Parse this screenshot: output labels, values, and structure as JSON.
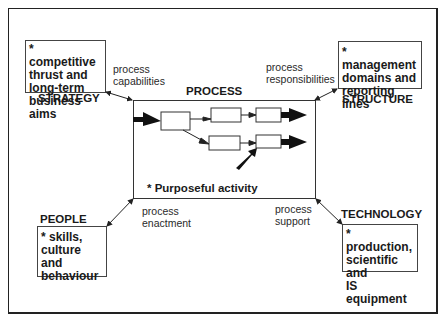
{
  "diagram": {
    "center": {
      "title": "PROCESS",
      "description": "* Purposeful activity"
    },
    "strategy": {
      "label": "STRATEGY",
      "lines": [
        "* competitive",
        "thrust and",
        "long-term",
        "business aims"
      ],
      "link_label": [
        "process",
        "capabilities"
      ]
    },
    "structure": {
      "label": "STRUCTURE",
      "lines": [
        "* management",
        "domains and",
        "reporting lines"
      ],
      "link_label": [
        "process",
        "responsibilities"
      ]
    },
    "people": {
      "label": "PEOPLE",
      "lines": [
        "* skills,",
        "culture and",
        "behaviour"
      ],
      "link_label": [
        "process",
        "enactment"
      ]
    },
    "technology": {
      "label": "TECHNOLOGY",
      "lines": [
        "* production,",
        "scientific and",
        "IS equipment"
      ],
      "link_label": [
        "process",
        "support"
      ]
    }
  }
}
